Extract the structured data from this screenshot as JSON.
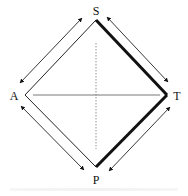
{
  "diagram": {
    "nodes": [
      {
        "id": "S",
        "label": "S",
        "x": 96,
        "y": 11
      },
      {
        "id": "A",
        "label": "A",
        "x": 14,
        "y": 96
      },
      {
        "id": "T",
        "label": "T",
        "x": 176,
        "y": 96
      },
      {
        "id": "P",
        "label": "P",
        "x": 96,
        "y": 180
      }
    ],
    "edges": [
      {
        "from": "S",
        "to": "A",
        "style": "thin"
      },
      {
        "from": "S",
        "to": "T",
        "style": "thick"
      },
      {
        "from": "A",
        "to": "P",
        "style": "thin"
      },
      {
        "from": "P",
        "to": "T",
        "style": "thick"
      },
      {
        "from": "A",
        "to": "T",
        "style": "thin-horizontal"
      },
      {
        "from": "S",
        "to": "P",
        "style": "dotted-vertical"
      }
    ],
    "double_arrows": [
      {
        "between": [
          "S",
          "A"
        ],
        "side": "outer"
      },
      {
        "between": [
          "S",
          "T"
        ],
        "side": "outer"
      },
      {
        "between": [
          "A",
          "P"
        ],
        "side": "outer"
      },
      {
        "between": [
          "P",
          "T"
        ],
        "side": "outer"
      }
    ],
    "colors": {
      "stroke": "#111111",
      "background": "#ffffff"
    }
  }
}
